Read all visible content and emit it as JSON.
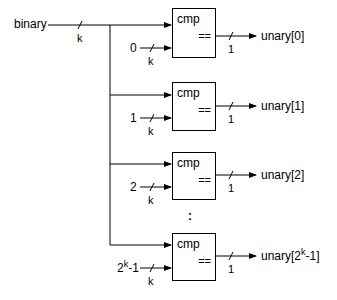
{
  "diagram": {
    "type": "binary-to-unary-decoder",
    "input": {
      "label": "binary",
      "width_label": "k"
    },
    "bus_width_label": "k",
    "ellipsis": ":",
    "comparators": [
      {
        "block_label": "cmp",
        "op_label": "==",
        "constant": "0",
        "constant_sup": "",
        "constant_suffix": "",
        "const_width": "k",
        "out_width": "1",
        "output": "unary[0]",
        "output_sup": "",
        "output_suffix": ""
      },
      {
        "block_label": "cmp",
        "op_label": "==",
        "constant": "1",
        "constant_sup": "",
        "constant_suffix": "",
        "const_width": "k",
        "out_width": "1",
        "output": "unary[1]",
        "output_sup": "",
        "output_suffix": ""
      },
      {
        "block_label": "cmp",
        "op_label": "==",
        "constant": "2",
        "constant_sup": "",
        "constant_suffix": "",
        "const_width": "k",
        "out_width": "1",
        "output": "unary[2]",
        "output_sup": "",
        "output_suffix": ""
      },
      {
        "block_label": "cmp",
        "op_label": "==",
        "constant": "2",
        "constant_sup": "k",
        "constant_suffix": "-1",
        "const_width": "k",
        "out_width": "1",
        "output": "unary[2",
        "output_sup": "k",
        "output_suffix": "-1]"
      }
    ]
  }
}
